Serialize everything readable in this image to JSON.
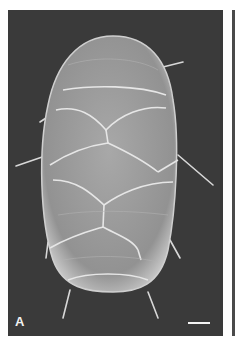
{
  "figure": {
    "panel_label": "A",
    "scale_bar": {
      "visible": true,
      "label": ""
    },
    "colors": {
      "background": "#3a3a3a",
      "specimen": "#bdbdbd",
      "plate_edges": "#e6e6e6",
      "frame": "#ffffff"
    }
  }
}
